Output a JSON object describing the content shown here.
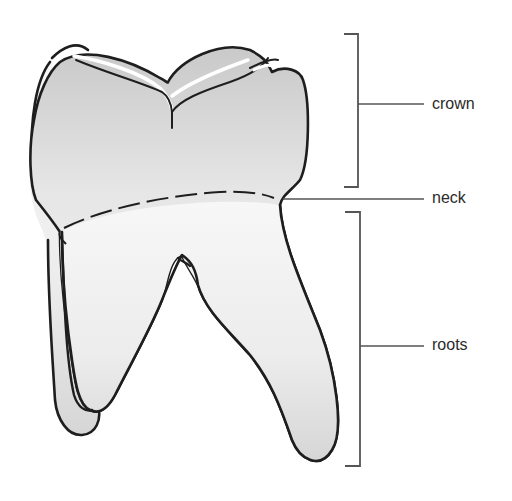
{
  "diagram": {
    "title": "",
    "labels": {
      "crown": "crown",
      "neck": "neck",
      "roots": "roots"
    },
    "colors": {
      "outline": "#1e1e1e",
      "fill_light": "#f4f4f4",
      "fill_shade": "#cfcfcf",
      "leader": "#555555"
    }
  }
}
